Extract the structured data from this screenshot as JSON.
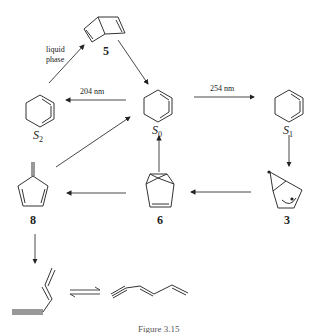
{
  "diagram": {
    "type": "photochemical reaction scheme",
    "nodes": {
      "S0": {
        "label": "S",
        "sub": "0",
        "structure": "benzene (ground state)"
      },
      "S1": {
        "label": "S",
        "sub": "1",
        "structure": "benzene (first excited singlet)"
      },
      "S2": {
        "label": "S",
        "sub": "2",
        "structure": "benzene (second excited singlet)"
      },
      "c5": {
        "label": "5",
        "structure": "Dewar benzene"
      },
      "c3": {
        "label": "3",
        "structure": "prefulvene biradical"
      },
      "c6": {
        "label": "6",
        "structure": "benzvalene"
      },
      "c8": {
        "label": "8",
        "structure": "fulvene"
      },
      "open_cis": {
        "label": "",
        "structure": "cis-hexa-1,3-dien-5-yne"
      },
      "open_trans": {
        "label": "",
        "structure": "trans-hexa-1,3-dien-5-yne"
      }
    },
    "edges": {
      "e1": {
        "from": "S0",
        "to": "S1",
        "label": "254 nm"
      },
      "e2": {
        "from": "S0",
        "to": "S2",
        "label": "204 nm"
      },
      "e3": {
        "from": "S2",
        "to": "5",
        "label_line1": "liquid",
        "label_line2": "phase"
      },
      "e4": {
        "from": "5",
        "to": "S0",
        "label": ""
      },
      "e5": {
        "from": "S1",
        "to": "3",
        "label": ""
      },
      "e6": {
        "from": "3",
        "to": "6",
        "label": ""
      },
      "e7": {
        "from": "6",
        "to": "S0",
        "label": ""
      },
      "e8": {
        "from": "6",
        "to": "8",
        "label": ""
      },
      "e9": {
        "from": "8",
        "to": "S0",
        "label": ""
      },
      "e10": {
        "from": "8",
        "to": "open_cis",
        "label": ""
      },
      "e11": {
        "from": "open_cis",
        "to": "open_trans",
        "label": "",
        "type": "equilibrium"
      }
    },
    "caption": "Figure 3.15"
  }
}
